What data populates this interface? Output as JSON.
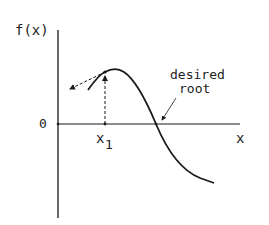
{
  "diagram": {
    "y_axis_label": "f(x)",
    "x_axis_label": "x",
    "origin_label": "0",
    "point_label": "x",
    "point_subscript": "1",
    "annotation_line1": "desired",
    "annotation_line2": "root",
    "colors": {
      "ink": "#1a1a1a",
      "background": "#ffffff"
    }
  }
}
